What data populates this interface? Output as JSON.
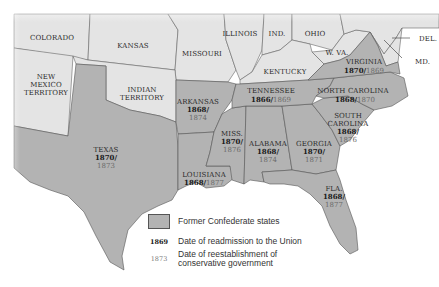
{
  "map": {
    "title": "Reconstruction of the South",
    "colors": {
      "confederate_fill": "#b3b3b3",
      "union_fill": "#e4e4e4",
      "border": "#555555",
      "background": "#ffffff"
    },
    "states": {
      "colorado": {
        "name": "COLORADO"
      },
      "kansas": {
        "name": "KANSAS"
      },
      "missouri": {
        "name": "MISSOURI"
      },
      "illinois": {
        "name": "ILLINOIS"
      },
      "indiana": {
        "name": "IND."
      },
      "ohio": {
        "name": "OHIO"
      },
      "west_virginia": {
        "name": "W. VA."
      },
      "kentucky": {
        "name": "KENTUCKY"
      },
      "new_mexico": {
        "name_lines": [
          "NEW",
          "MEXICO",
          "TERRITORY"
        ]
      },
      "indian_territory": {
        "name_lines": [
          "INDIAN",
          "TERRITORY"
        ]
      },
      "delaware": {
        "name": "DEL."
      },
      "maryland": {
        "name": "MD."
      },
      "virginia": {
        "name": "VIRGINIA",
        "readmission": "1870/",
        "conservative": "1869"
      },
      "north_carolina": {
        "name": "NORTH CAROLINA",
        "readmission": "1868/",
        "conservative": "1870"
      },
      "tennessee": {
        "name": "TENNESSEE",
        "readmission": "1866/",
        "conservative": "1869"
      },
      "arkansas": {
        "name": "ARKANSAS",
        "readmission": "1868/",
        "conservative": "1874"
      },
      "south_carolina": {
        "name_lines": [
          "SOUTH",
          "CAROLINA"
        ],
        "readmission": "1868/",
        "conservative": "1876"
      },
      "mississippi": {
        "name": "MISS.",
        "readmission": "1870/",
        "conservative": "1876"
      },
      "alabama": {
        "name": "ALABAMA",
        "readmission": "1868/",
        "conservative": "1874"
      },
      "georgia": {
        "name": "GEORGIA",
        "readmission": "1870/",
        "conservative": "1871"
      },
      "texas": {
        "name": "TEXAS",
        "readmission": "1870/",
        "conservative": "1873"
      },
      "louisiana": {
        "name": "LOUISIANA",
        "readmission": "1868/",
        "conservative": "1877"
      },
      "florida": {
        "name": "FLA.",
        "readmission": "1868/",
        "conservative": "1877"
      }
    }
  },
  "legend": {
    "confederate_label": "Former Confederate states",
    "readmission_sample": "1869",
    "readmission_label": "Date of readmission to the Union",
    "conservative_sample": "1873",
    "conservative_label_lines": [
      "Date of reestablishment of",
      "conservative government"
    ]
  }
}
